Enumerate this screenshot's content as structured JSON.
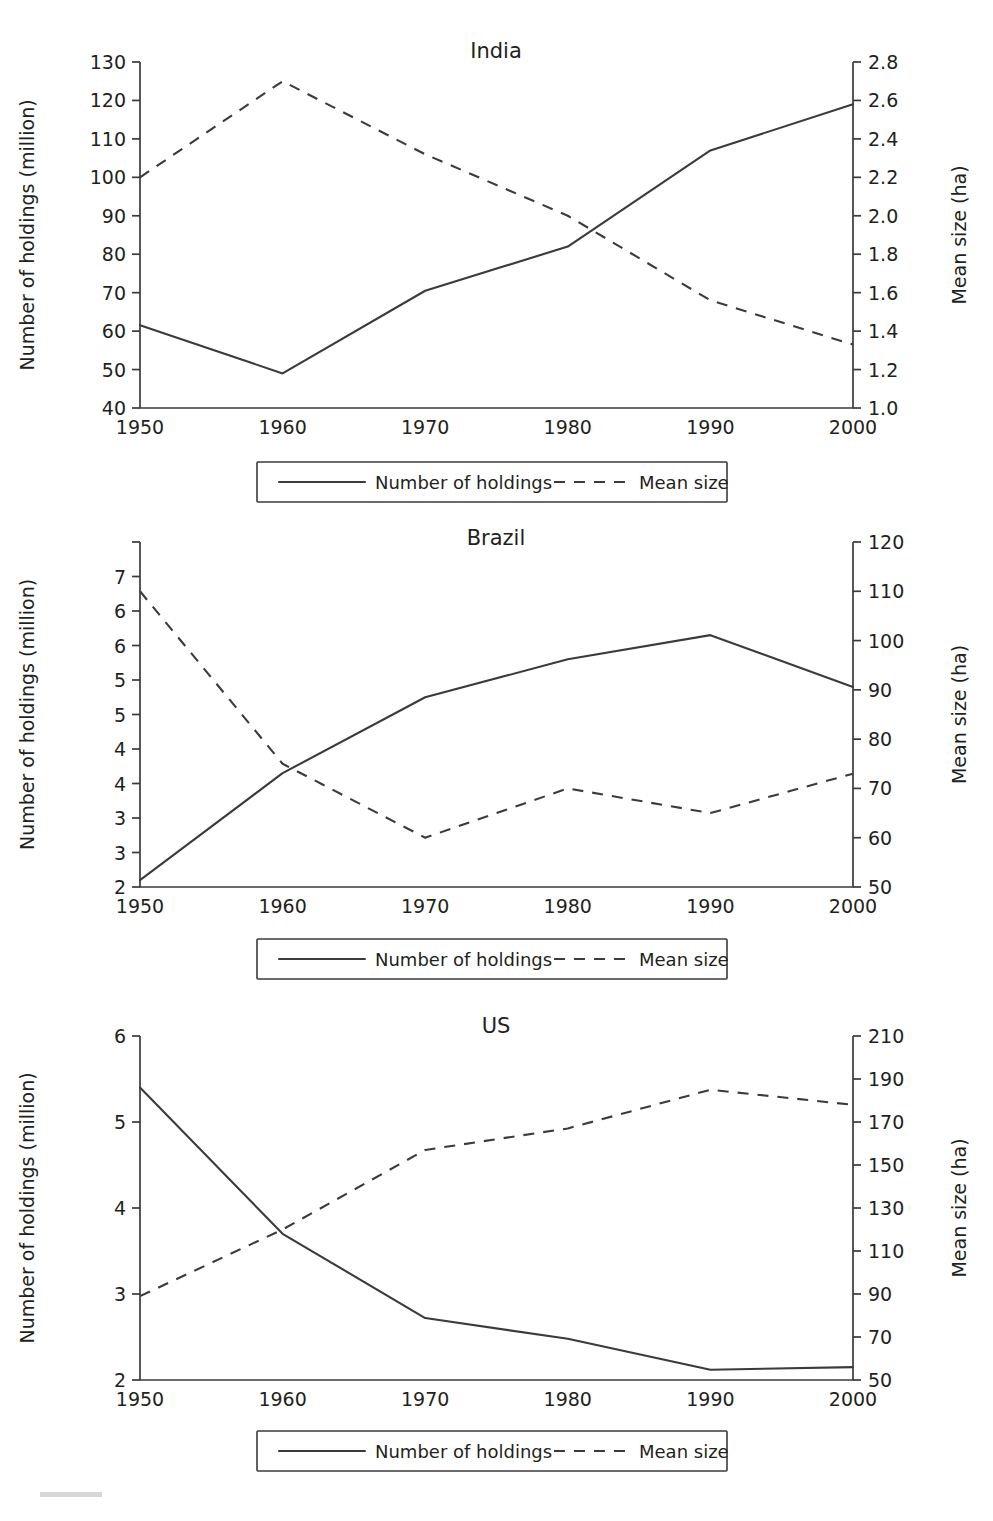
{
  "legend": {
    "series_solid_label": "Number of holdings",
    "series_dashed_label": "Mean size"
  },
  "axis_titles": {
    "left": "Number of holdings (million)",
    "right": "Mean size (ha)"
  },
  "chart_data": [
    {
      "type": "line",
      "title": "India",
      "xlabel": "",
      "ylabel": "Number of holdings (million)",
      "y2label": "Mean size (ha)",
      "x": [
        1950,
        1960,
        1970,
        1980,
        1990,
        2000
      ],
      "xticklabels": [
        "1950",
        "1960",
        "1970",
        "1980",
        "1990",
        "2000"
      ],
      "ylim": [
        40,
        130
      ],
      "yticks": [
        40,
        50,
        60,
        70,
        80,
        90,
        100,
        110,
        120,
        130
      ],
      "yticklabels": [
        "40",
        "50",
        "60",
        "70",
        "80",
        "90",
        "100",
        "110",
        "120",
        "130"
      ],
      "y2lim": [
        1.0,
        2.8
      ],
      "y2ticks": [
        1.0,
        1.2,
        1.4,
        1.6,
        1.8,
        2.0,
        2.2,
        2.4,
        2.6,
        2.8
      ],
      "y2ticklabels": [
        "1.0",
        "1.2",
        "1.4",
        "1.6",
        "1.8",
        "2.0",
        "2.2",
        "2.4",
        "2.6",
        "2.8"
      ],
      "grid": false,
      "legend_position": "below",
      "series": [
        {
          "name": "Number of holdings",
          "axis": "left",
          "style": "solid",
          "values": [
            61.5,
            49.0,
            70.5,
            82.0,
            107.0,
            119.0
          ]
        },
        {
          "name": "Mean size",
          "axis": "right",
          "style": "dashed",
          "values": [
            2.2,
            2.7,
            2.32,
            2.0,
            1.56,
            1.33
          ]
        }
      ]
    },
    {
      "type": "line",
      "title": "Brazil",
      "xlabel": "",
      "ylabel": "Number of holdings (million)",
      "y2label": "Mean size (ha)",
      "x": [
        1950,
        1960,
        1970,
        1980,
        1990,
        2000
      ],
      "xticklabels": [
        "1950",
        "1960",
        "1970",
        "1980",
        "1990",
        "2000"
      ],
      "ylim": [
        2,
        7
      ],
      "yticks": [
        2,
        2.5,
        3,
        3.5,
        4,
        4.5,
        5,
        5.5,
        6,
        6.5,
        7
      ],
      "yticklabels": [
        "2",
        "3",
        "3",
        "4",
        "4",
        "5",
        "5",
        "6",
        "6",
        "7"
      ],
      "y2lim": [
        50,
        120
      ],
      "y2ticks": [
        50,
        60,
        70,
        80,
        90,
        100,
        110,
        120
      ],
      "y2ticklabels": [
        "50",
        "60",
        "70",
        "80",
        "90",
        "100",
        "110",
        "120"
      ],
      "grid": false,
      "legend_position": "below",
      "series": [
        {
          "name": "Number of holdings",
          "axis": "left",
          "style": "solid",
          "values": [
            2.1,
            3.65,
            4.75,
            5.3,
            5.65,
            4.9
          ]
        },
        {
          "name": "Mean size",
          "axis": "right",
          "style": "dashed",
          "values": [
            110.0,
            75.0,
            60.0,
            70.0,
            65.0,
            73.0
          ]
        }
      ]
    },
    {
      "type": "line",
      "title": "US",
      "xlabel": "",
      "ylabel": "Number of holdings (million)",
      "y2label": "Mean size (ha)",
      "x": [
        1950,
        1960,
        1970,
        1980,
        1990,
        2000
      ],
      "xticklabels": [
        "1950",
        "1960",
        "1970",
        "1980",
        "1990",
        "2000"
      ],
      "ylim": [
        2,
        6
      ],
      "yticks": [
        2,
        3,
        4,
        5,
        6
      ],
      "yticklabels": [
        "2",
        "3",
        "4",
        "5",
        "6"
      ],
      "y2lim": [
        50,
        210
      ],
      "y2ticks": [
        50,
        70,
        90,
        110,
        130,
        150,
        170,
        190,
        210
      ],
      "y2ticklabels": [
        "50",
        "70",
        "90",
        "110",
        "130",
        "150",
        "170",
        "190",
        "210"
      ],
      "grid": false,
      "legend_position": "below",
      "series": [
        {
          "name": "Number of holdings",
          "axis": "left",
          "style": "solid",
          "values": [
            5.4,
            3.7,
            2.72,
            2.48,
            2.12,
            2.15
          ]
        },
        {
          "name": "Mean size",
          "axis": "right",
          "style": "dashed",
          "values": [
            89.0,
            120.0,
            157.0,
            167.0,
            185.0,
            178.0
          ]
        }
      ]
    }
  ]
}
